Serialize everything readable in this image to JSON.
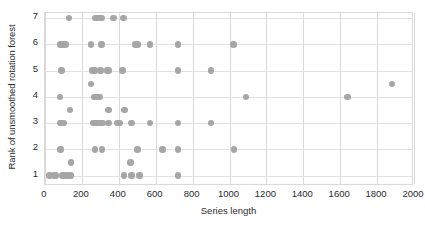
{
  "chart_data": {
    "type": "scatter",
    "title": "",
    "xlabel": "Series length",
    "ylabel": "Rank of unsmoothed rotation forest",
    "xlim": [
      0,
      2000
    ],
    "ylim": [
      0.6,
      7.2
    ],
    "xticks": [
      0,
      200,
      400,
      600,
      800,
      1000,
      1200,
      1400,
      1600,
      1800,
      2000
    ],
    "yticks": [
      1,
      2,
      3,
      4,
      5,
      6,
      7
    ],
    "grid": "both",
    "legend": "none",
    "marker_color": "#a6a6a6",
    "marker_size": 6.5,
    "points": [
      {
        "x": 24,
        "y": 1
      },
      {
        "x": 48,
        "y": 1
      },
      {
        "x": 60,
        "y": 1
      },
      {
        "x": 96,
        "y": 1
      },
      {
        "x": 110,
        "y": 1
      },
      {
        "x": 128,
        "y": 1
      },
      {
        "x": 140,
        "y": 1
      },
      {
        "x": 427,
        "y": 1
      },
      {
        "x": 470,
        "y": 1
      },
      {
        "x": 512,
        "y": 1
      },
      {
        "x": 720,
        "y": 1
      },
      {
        "x": 140,
        "y": 1.5
      },
      {
        "x": 463,
        "y": 1.5
      },
      {
        "x": 84,
        "y": 2
      },
      {
        "x": 270,
        "y": 2
      },
      {
        "x": 310,
        "y": 2
      },
      {
        "x": 500,
        "y": 2
      },
      {
        "x": 637,
        "y": 2
      },
      {
        "x": 720,
        "y": 2
      },
      {
        "x": 1024,
        "y": 2
      },
      {
        "x": 80,
        "y": 3
      },
      {
        "x": 90,
        "y": 3
      },
      {
        "x": 104,
        "y": 3
      },
      {
        "x": 264,
        "y": 3
      },
      {
        "x": 275,
        "y": 3
      },
      {
        "x": 286,
        "y": 3
      },
      {
        "x": 300,
        "y": 3
      },
      {
        "x": 315,
        "y": 3
      },
      {
        "x": 345,
        "y": 3
      },
      {
        "x": 390,
        "y": 3
      },
      {
        "x": 405,
        "y": 3
      },
      {
        "x": 470,
        "y": 3
      },
      {
        "x": 570,
        "y": 3
      },
      {
        "x": 720,
        "y": 3
      },
      {
        "x": 900,
        "y": 3
      },
      {
        "x": 135,
        "y": 3.5
      },
      {
        "x": 345,
        "y": 3.5
      },
      {
        "x": 432,
        "y": 3.5
      },
      {
        "x": 80,
        "y": 4
      },
      {
        "x": 265,
        "y": 4
      },
      {
        "x": 275,
        "y": 4
      },
      {
        "x": 286,
        "y": 4
      },
      {
        "x": 296,
        "y": 4
      },
      {
        "x": 1090,
        "y": 4
      },
      {
        "x": 1640,
        "y": 4
      },
      {
        "x": 248,
        "y": 4.5
      },
      {
        "x": 1880,
        "y": 4.5
      },
      {
        "x": 90,
        "y": 5
      },
      {
        "x": 258,
        "y": 5
      },
      {
        "x": 270,
        "y": 5
      },
      {
        "x": 300,
        "y": 5
      },
      {
        "x": 335,
        "y": 5
      },
      {
        "x": 345,
        "y": 5
      },
      {
        "x": 420,
        "y": 5
      },
      {
        "x": 720,
        "y": 5
      },
      {
        "x": 900,
        "y": 5
      },
      {
        "x": 84,
        "y": 6
      },
      {
        "x": 100,
        "y": 6
      },
      {
        "x": 112,
        "y": 6
      },
      {
        "x": 250,
        "y": 6
      },
      {
        "x": 305,
        "y": 6
      },
      {
        "x": 490,
        "y": 6
      },
      {
        "x": 505,
        "y": 6
      },
      {
        "x": 570,
        "y": 6
      },
      {
        "x": 720,
        "y": 6
      },
      {
        "x": 1022,
        "y": 6
      },
      {
        "x": 130,
        "y": 7
      },
      {
        "x": 272,
        "y": 7
      },
      {
        "x": 284,
        "y": 7
      },
      {
        "x": 296,
        "y": 7
      },
      {
        "x": 308,
        "y": 7
      },
      {
        "x": 372,
        "y": 7
      },
      {
        "x": 425,
        "y": 7
      }
    ]
  }
}
